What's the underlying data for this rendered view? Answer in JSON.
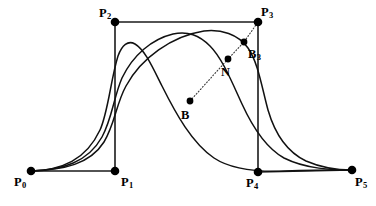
{
  "figure": {
    "width": 376,
    "height": 206,
    "background_color": "#ffffff",
    "ink_color": "#000000"
  },
  "chart_data": {
    "type": "line",
    "xlabel": "",
    "ylabel": "",
    "xlim": [
      0,
      376
    ],
    "ylim": [
      206,
      0
    ],
    "grid": false,
    "legend": "none",
    "axes_visible": false,
    "control_points": [
      {
        "name": "P0",
        "label": "P",
        "subscript": "0",
        "x": 31,
        "y": 171,
        "label_x": 14,
        "label_y": 176
      },
      {
        "name": "P1",
        "label": "P",
        "subscript": "1",
        "x": 115,
        "y": 171,
        "label_x": 121,
        "label_y": 176
      },
      {
        "name": "P2",
        "label": "P",
        "subscript": "2",
        "x": 115,
        "y": 22,
        "label_x": 99,
        "label_y": 7
      },
      {
        "name": "P3",
        "label": "P",
        "subscript": "3",
        "x": 258,
        "y": 22,
        "label_x": 261,
        "label_y": 6
      },
      {
        "name": "P4",
        "label": "P",
        "subscript": "4",
        "x": 258,
        "y": 172,
        "label_x": 246,
        "label_y": 177
      },
      {
        "name": "P5",
        "label": "P",
        "subscript": "5",
        "x": 352,
        "y": 170,
        "label_x": 355,
        "label_y": 176
      }
    ],
    "derived_points": [
      {
        "name": "B",
        "label": "B",
        "subscript": "",
        "x": 190,
        "y": 101,
        "label_x": 181,
        "label_y": 109
      },
      {
        "name": "N",
        "label": "N",
        "subscript": "",
        "x": 228,
        "y": 59,
        "label_x": 221,
        "label_y": 66
      },
      {
        "name": "B3",
        "label": "B",
        "subscript": "3",
        "x": 244,
        "y": 42,
        "label_x": 248,
        "label_y": 48
      }
    ],
    "polygon_edges": [
      {
        "name": "P0-P1",
        "from": "P0",
        "to": "P1"
      },
      {
        "name": "P1-P2",
        "from": "P1",
        "to": "P2"
      },
      {
        "name": "P2-P3",
        "from": "P2",
        "to": "P3"
      },
      {
        "name": "P3-P4",
        "from": "P3",
        "to": "P4"
      },
      {
        "name": "P4-P5",
        "from": "P4",
        "to": "P5"
      }
    ],
    "dotted_ray": {
      "name": "B-to-P3-ray",
      "points": [
        "B",
        "N",
        "B3",
        "P3"
      ],
      "path": "M 190 101 L 228 59 L 244 42 L 258 22"
    },
    "series": [
      {
        "name": "curve-1-early-peak",
        "description": "Leftmost / earliest-peaking spline, apex near x=127",
        "peak": {
          "x": 127,
          "y": 42
        },
        "path": "M 31 171 C 62 170 86 160 100 130 C 108 113 111 78 118 56 C 122 45 128 40 135 44 C 145 50 152 66 162 86 C 176 114 192 143 214 158 C 232 170 260 172 285 171 C 312 170 336 170 352 170"
      },
      {
        "name": "curve-2-middle-peak",
        "description": "Middle spline, apex near x=185",
        "peak": {
          "x": 185,
          "y": 33
        },
        "path": "M 31 171 C 63 170 88 162 102 137 C 112 119 114 96 122 78 C 133 55 152 39 173 34 C 188 31 199 35 210 46 C 222 58 231 80 242 104 C 253 128 266 148 284 158 C 306 169 332 170 352 170"
      },
      {
        "name": "curve-3-late-peak",
        "description": "Rightmost / latest-peaking spline, apex near x=226",
        "peak": {
          "x": 226,
          "y": 30
        },
        "path": "M 31 171 C 64 170 90 164 104 142 C 115 124 116 104 126 86 C 141 58 172 36 204 31 C 221 29 238 34 248 48 C 258 62 262 88 268 110 C 275 134 287 152 306 161 C 322 168 339 170 352 170"
      }
    ],
    "annotations": [
      {
        "text": "P",
        "sub": "0",
        "role": "control-point-label"
      },
      {
        "text": "P",
        "sub": "1",
        "role": "control-point-label"
      },
      {
        "text": "P",
        "sub": "2",
        "role": "control-point-label"
      },
      {
        "text": "P",
        "sub": "3",
        "role": "control-point-label"
      },
      {
        "text": "P",
        "sub": "4",
        "role": "control-point-label"
      },
      {
        "text": "P",
        "sub": "5",
        "role": "control-point-label"
      },
      {
        "text": "B",
        "sub": "",
        "role": "derived-point-label"
      },
      {
        "text": "N",
        "sub": "",
        "role": "derived-point-label"
      },
      {
        "text": "B",
        "sub": "3",
        "role": "derived-point-label"
      }
    ]
  }
}
